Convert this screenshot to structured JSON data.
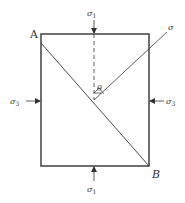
{
  "diagram": {
    "points": {
      "A": "A",
      "B": "B"
    },
    "labels": {
      "sigma_top": "σ",
      "sigma_top_sub": "1",
      "sigma_bottom": "σ",
      "sigma_bottom_sub": "1",
      "sigma_left": "σ",
      "sigma_left_sub": "3",
      "sigma_right": "σ",
      "sigma_right_sub": "3",
      "sigma_normal": "σ",
      "angle": "θ"
    },
    "colors": {
      "stroke": "#333333",
      "background": "#ffffff"
    }
  }
}
